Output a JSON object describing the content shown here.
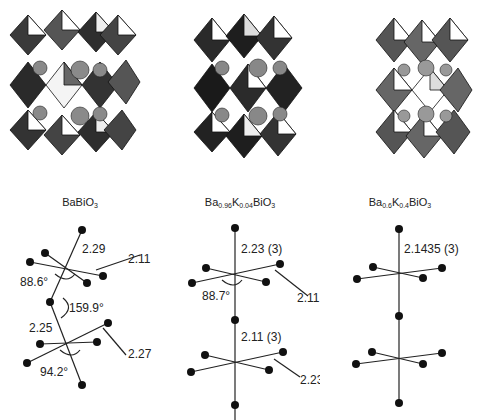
{
  "panels": [
    {
      "id": "BaBiO3",
      "formula": {
        "parts": [
          {
            "t": "BaBiO"
          },
          {
            "s": "3"
          }
        ]
      },
      "formula_text": "BaBiO3",
      "octahedron_style": "tilted, mixed dark/light faces",
      "geometry": {
        "upper_apical_bond": "2.29",
        "upper_equatorial_bond": "2.11",
        "upper_angle": "88.6°",
        "bridge_angle": "159.9°",
        "lower_apical_bond": "2.25",
        "lower_equatorial_bond": "2.27",
        "lower_angle": "94.2°"
      }
    },
    {
      "id": "Ba0.96K0.04BiO3",
      "formula": {
        "parts": [
          {
            "t": "Ba"
          },
          {
            "s": "0.96"
          },
          {
            "t": "K"
          },
          {
            "s": "0.04"
          },
          {
            "t": "BiO"
          },
          {
            "s": "3"
          }
        ]
      },
      "formula_text": "Ba0.96K0.04BiO3",
      "octahedron_style": "tilted, predominantly dark faces",
      "geometry": {
        "upper_apical_bond": "2.23 (3)",
        "upper_equatorial_bond": "2.11 (3)",
        "upper_angle": "88.7°",
        "lower_apical_bond": "2.11 (3)",
        "lower_equatorial_bond": "2.23 (3)"
      }
    },
    {
      "id": "Ba0.6K0.4BiO3",
      "formula": {
        "parts": [
          {
            "t": "Ba"
          },
          {
            "s": "0.6"
          },
          {
            "t": "K"
          },
          {
            "s": "0.4"
          },
          {
            "t": "BiO"
          },
          {
            "s": "3"
          }
        ]
      },
      "formula_text": "Ba0.6K0.4BiO3",
      "octahedron_style": "untilted cubic, light faces",
      "geometry": {
        "apical_bond": "2.1435 (3)"
      }
    }
  ]
}
